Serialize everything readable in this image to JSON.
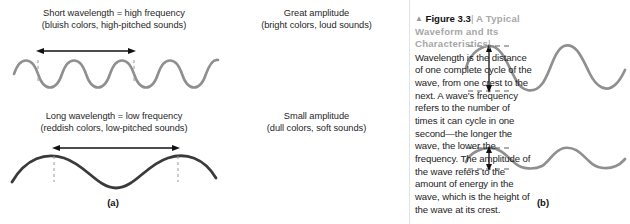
{
  "figure": {
    "background": "#ffffff",
    "panels": [
      {
        "letter": "(a)",
        "top_caption": "Short wavelength = high frequency\n(bluish colors, high-pitched sounds)",
        "bottom_caption": "Long wavelength = low frequency\n(reddish colors, low-pitched sounds)"
      },
      {
        "letter": "(b)",
        "top_caption": "Great amplitude\n(bright colors, loud sounds)",
        "bottom_caption": "Small amplitude\n(dull colors, soft sounds)"
      }
    ],
    "caption": {
      "marker": "▲",
      "label": "Figure 3.3",
      "separator": "|",
      "title": "A Typical Waveform and Its Characteristics",
      "title_separator": "|",
      "body": "Wavelength is the distance of one complete cycle of the wave, from one crest to the next. A wave's frequency refers to the number of times it can cycle in one second—the longer the wave, the lower the frequency. The amplitude of the wave refers to the amount of energy in the wave, which is the height of the wave at its crest."
    },
    "colors": {
      "wave_light_gray": "#8f8f8f",
      "wave_dark": "#3a3a3a",
      "annotation_black": "#111111",
      "dashed_gray": "#9a9a9a",
      "title_gray": "#a7a7a7",
      "text_black": "#1c1c1c"
    },
    "waves": [
      {
        "name": "short-wavelength-wave",
        "cycles": 4.5,
        "stroke": "#8f8f8f",
        "annotation": "wavelength-arrow-horizontal"
      },
      {
        "name": "long-wavelength-wave",
        "cycles": 1.5,
        "stroke": "#3a3a3a",
        "annotation": "wavelength-arrow-horizontal"
      },
      {
        "name": "great-amplitude-wave",
        "cycles": 2.25,
        "stroke": "#8f8f8f",
        "annotation": "amplitude-arrow-vertical"
      },
      {
        "name": "small-amplitude-wave",
        "cycles": 2.25,
        "stroke": "#8f8f8f",
        "annotation": "amplitude-arrow-vertical"
      }
    ]
  }
}
